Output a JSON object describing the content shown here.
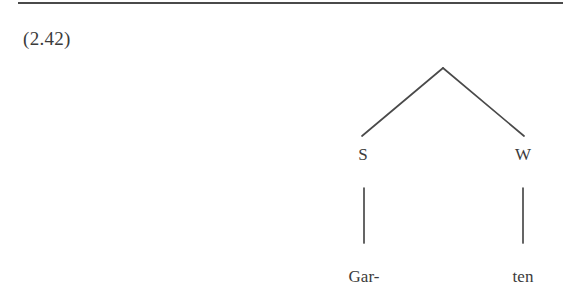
{
  "page": {
    "example_number": "(2.42)",
    "background_color": "#ffffff",
    "ink_color": "#3b3b3b",
    "rule_color": "#4a4a4a"
  },
  "tree": {
    "root": {
      "label": "",
      "x": 443,
      "y": 68
    },
    "nodes": [
      {
        "id": "strong",
        "label": "S",
        "x": 363,
        "y": 161,
        "branch_from": [
          443,
          68
        ],
        "branch_to": [
          362,
          136
        ]
      },
      {
        "id": "weak",
        "label": "W",
        "x": 523,
        "y": 161,
        "branch_from": [
          443,
          68
        ],
        "branch_to": [
          524,
          136
        ]
      }
    ],
    "terminals": [
      {
        "id": "terminal-gar",
        "label": "Gar-",
        "parent": "strong",
        "x": 364,
        "y": 283,
        "stem_from": [
          364,
          188
        ],
        "stem_to": [
          364,
          243
        ]
      },
      {
        "id": "terminal-ten",
        "label": "ten",
        "parent": "weak",
        "x": 523,
        "y": 283,
        "stem_from": [
          523,
          188
        ],
        "stem_to": [
          523,
          243
        ]
      }
    ]
  }
}
